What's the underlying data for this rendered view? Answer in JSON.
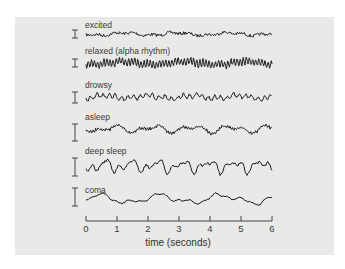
{
  "chart_data": {
    "type": "line",
    "title": "",
    "xlabel": "time (seconds)",
    "ylabel": "",
    "xlim": [
      0,
      6
    ],
    "x_ticks": [
      "0",
      "1",
      "2",
      "3",
      "4",
      "5",
      "6"
    ],
    "grid": false,
    "legend": "none",
    "series": [
      {
        "name": "excited",
        "amplitude": "very low",
        "frequency": "high, irregular"
      },
      {
        "name": "relaxed (alpha rhythm)",
        "amplitude": "medium",
        "frequency": "regular ~10 Hz"
      },
      {
        "name": "drowsy",
        "amplitude": "low-medium",
        "frequency": "mixed"
      },
      {
        "name": "asleep",
        "amplitude": "medium",
        "frequency": "slower with spindles"
      },
      {
        "name": "deep sleep",
        "amplitude": "high",
        "frequency": "slow delta waves"
      },
      {
        "name": "coma",
        "amplitude": "medium",
        "frequency": "very slow"
      }
    ]
  },
  "labels": {
    "excited": "excited",
    "relaxed": "relaxed (alpha rhythm)",
    "drowsy": "drowsy",
    "asleep": "asleep",
    "deep_sleep": "deep sleep",
    "coma": "coma",
    "xlabel": "time (seconds)",
    "ticks": [
      "0",
      "1",
      "2",
      "3",
      "4",
      "5",
      "6"
    ]
  },
  "colors": {
    "panel": "#e9e9e7",
    "trace": "#1e1e1e",
    "text": "#3a3a3a"
  }
}
